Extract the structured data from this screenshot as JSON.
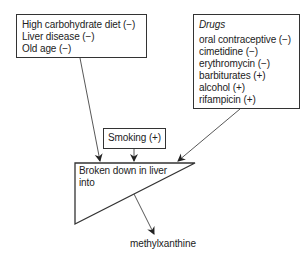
{
  "factors_box": {
    "items": [
      "High carbohydrate diet (−)",
      "Liver disease (−)",
      "Old age (−)"
    ]
  },
  "drugs_box": {
    "title": "Drugs",
    "items": [
      "oral contraceptive (−)",
      "cimetidine (−)",
      "erythromycin (−)",
      "barbiturates (+)",
      "alcohol (+)",
      "rifampicin (+)"
    ]
  },
  "smoking_box": {
    "label": "Smoking (+)"
  },
  "liver_process": {
    "line1": "Broken down in liver",
    "line2": "into"
  },
  "product": {
    "label": "methylxanthine"
  },
  "colors": {
    "stroke": "#333333",
    "text": "#222222",
    "background": "#ffffff"
  }
}
